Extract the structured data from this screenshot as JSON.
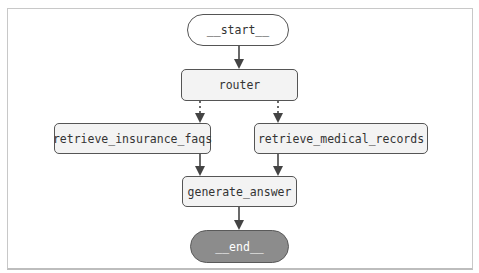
{
  "diagram": {
    "type": "flowchart",
    "nodes": {
      "start": {
        "label": "__start__",
        "shape": "pill"
      },
      "router": {
        "label": "router",
        "shape": "rect"
      },
      "retrieve_insurance_faqs": {
        "label": "retrieve_insurance_faqs",
        "shape": "rect"
      },
      "retrieve_medical_records": {
        "label": "retrieve_medical_records",
        "shape": "rect"
      },
      "generate_answer": {
        "label": "generate_answer",
        "shape": "rect"
      },
      "end": {
        "label": "__end__",
        "shape": "pill"
      }
    },
    "edges": [
      {
        "from": "__start__",
        "to": "router",
        "style": "solid"
      },
      {
        "from": "router",
        "to": "retrieve_insurance_faqs",
        "style": "dotted"
      },
      {
        "from": "router",
        "to": "retrieve_medical_records",
        "style": "dotted"
      },
      {
        "from": "retrieve_insurance_faqs",
        "to": "generate_answer",
        "style": "solid"
      },
      {
        "from": "retrieve_medical_records",
        "to": "generate_answer",
        "style": "solid"
      },
      {
        "from": "generate_answer",
        "to": "__end__",
        "style": "solid"
      }
    ],
    "colors": {
      "node_fill": "#f3f3f3",
      "node_border": "#555555",
      "end_fill": "#8c8c8c",
      "edge": "#444444"
    }
  }
}
